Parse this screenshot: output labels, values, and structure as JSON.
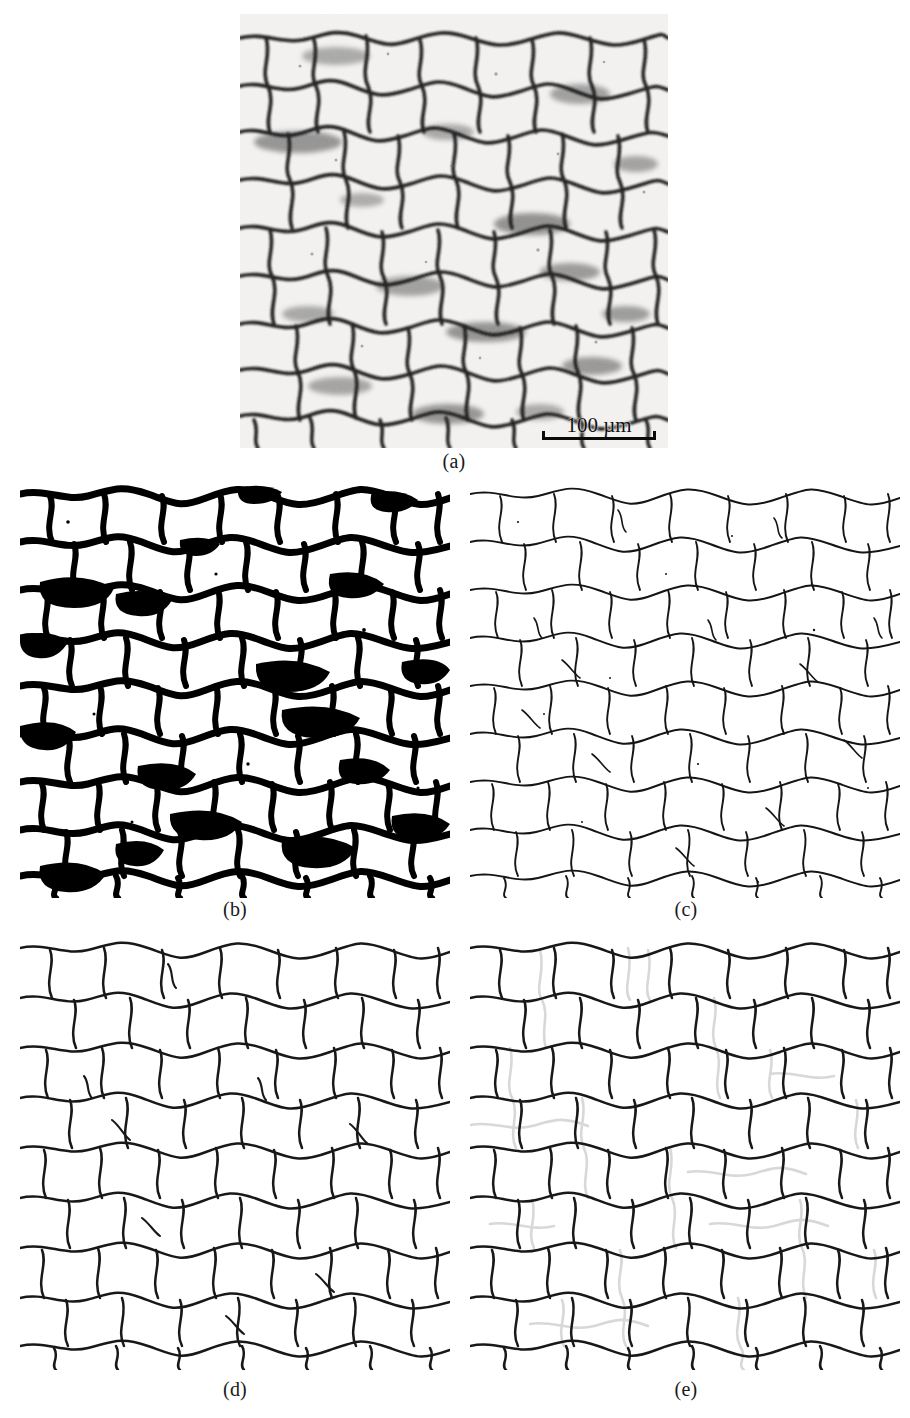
{
  "figure": {
    "panels": [
      {
        "id": "a",
        "label": "(a)",
        "caption_label": "(a)",
        "kind": "grayscale-micrograph",
        "description": "optical micrograph of polycrystalline grain structure",
        "scalebar": {
          "value": "100",
          "unit": "µm",
          "text": "100 µm"
        }
      },
      {
        "id": "b",
        "label": "(b)",
        "caption_label": "(b)",
        "kind": "binary-threshold",
        "description": "binarised image after thresholding, thick black grain boundaries"
      },
      {
        "id": "c",
        "label": "(c)",
        "caption_label": "(c)",
        "kind": "skeleton-thin",
        "description": "thinned / skeletonised grain boundary network"
      },
      {
        "id": "d",
        "label": "(d)",
        "caption_label": "(d)",
        "kind": "smoothed-boundaries",
        "description": "smoothed and pruned grain boundary network"
      },
      {
        "id": "e",
        "label": "(e)",
        "caption_label": "(e)",
        "kind": "boundaries-with-overlay",
        "description": "final boundary network with reconstructed boundaries shown in light grey"
      }
    ],
    "colors": {
      "background": "#ffffff",
      "boundary_black": "#111111",
      "boundary_thick": "#000000",
      "overlay_grey": "#d8d8d8",
      "micrograph_light": "#f2f0ee",
      "micrograph_mid": "#9a9a9a",
      "micrograph_dark": "#1c1c1c",
      "label_text": "#1a1a1a"
    },
    "layout": {
      "rows": 3,
      "row1_panels": [
        "a"
      ],
      "row2_panels": [
        "b",
        "c"
      ],
      "row3_panels": [
        "d",
        "e"
      ]
    }
  }
}
